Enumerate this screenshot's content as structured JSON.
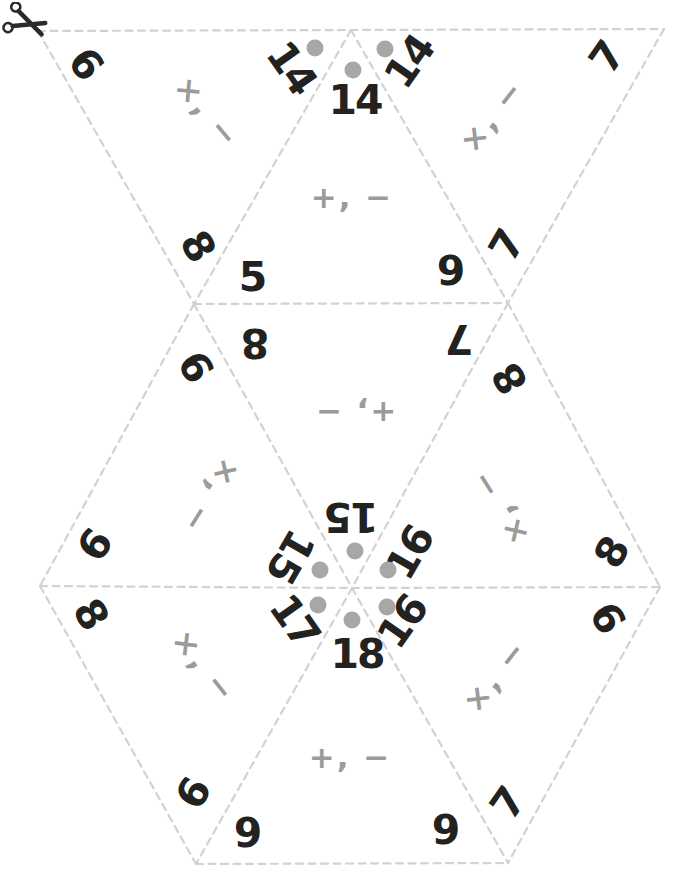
{
  "sheet": {
    "kind": "triangle-puzzle-cutout",
    "background": "#ffffff"
  },
  "colors": {
    "number": "#222220",
    "operator": "#9b9b9a",
    "target_dot": "#a7a7a6",
    "cut_line": "#d2d2d2",
    "scissors": "#2b2b2b"
  },
  "icons": {
    "scissors": "scissors-icon"
  },
  "triangles": [
    {
      "id": "T1",
      "op": "×, −",
      "corners": [
        {
          "value": "6"
        },
        {
          "value": "14",
          "dot": true
        },
        {
          "value": "8"
        }
      ]
    },
    {
      "id": "T2",
      "op": "+, −",
      "corners": [
        {
          "value": "14",
          "dot": true
        },
        {
          "value": "5"
        },
        {
          "value": "9"
        }
      ]
    },
    {
      "id": "T3",
      "op": "×, −",
      "corners": [
        {
          "value": "14",
          "dot": true
        },
        {
          "value": "7"
        },
        {
          "value": "7"
        }
      ]
    },
    {
      "id": "T4",
      "op": "×, −",
      "corners": [
        {
          "value": "9"
        },
        {
          "value": "6"
        },
        {
          "value": "15",
          "dot": true
        }
      ]
    },
    {
      "id": "T5",
      "op": "+, −",
      "corners": [
        {
          "value": "8"
        },
        {
          "value": "7"
        },
        {
          "value": "15",
          "dot": true
        }
      ]
    },
    {
      "id": "T6",
      "op": "×, −",
      "corners": [
        {
          "value": "8"
        },
        {
          "value": "16",
          "dot": true
        },
        {
          "value": "8"
        }
      ]
    },
    {
      "id": "T7",
      "op": "×, −",
      "corners": [
        {
          "value": "8"
        },
        {
          "value": "17",
          "dot": true
        },
        {
          "value": "9"
        }
      ]
    },
    {
      "id": "T8",
      "op": "+, −",
      "corners": [
        {
          "value": "18",
          "dot": true
        },
        {
          "value": "9"
        },
        {
          "value": "9"
        }
      ]
    },
    {
      "id": "T9",
      "op": "×, −",
      "corners": [
        {
          "value": "16",
          "dot": true
        },
        {
          "value": "9"
        },
        {
          "value": "7"
        }
      ]
    }
  ]
}
